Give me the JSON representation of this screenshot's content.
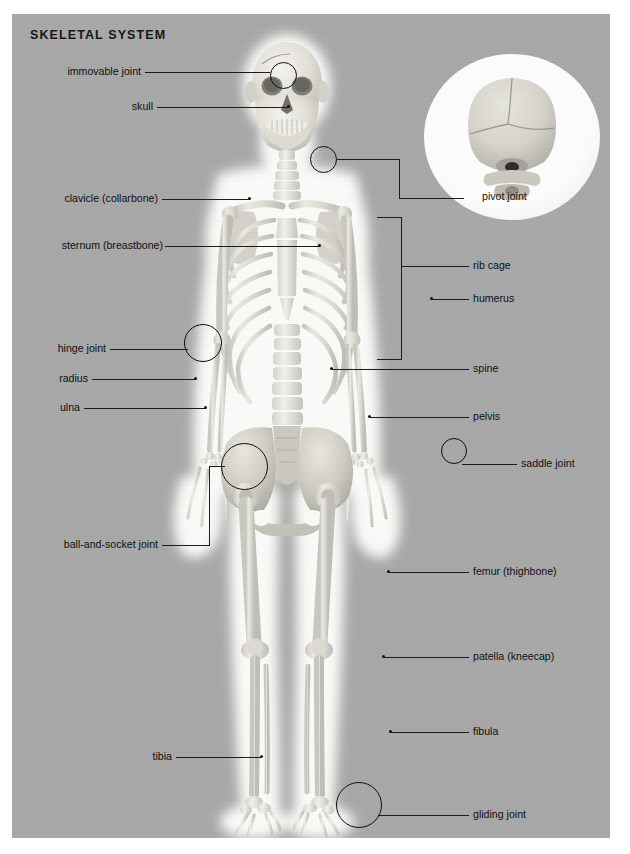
{
  "poster": {
    "title": "SKELETAL SYSTEM",
    "background_color": "#a8a8a8",
    "page_background": "#ffffff",
    "leader_color": "#1a1a1a",
    "text_color": "#0d0d0d"
  },
  "figure": {
    "name": "human-skeleton-anterior-view"
  },
  "inset": {
    "name": "pivot-joint-detail",
    "caption": "pivot joint",
    "description": "Posterior view of skull with atlas and axis vertebrae"
  },
  "labels_left": [
    {
      "id": "immovable-joint",
      "text": "immovable joint"
    },
    {
      "id": "skull",
      "text": "skull"
    },
    {
      "id": "clavicle",
      "text": "clavicle (collarbone)"
    },
    {
      "id": "sternum",
      "text": "sternum (breastbone)"
    },
    {
      "id": "hinge-joint",
      "text": "hinge joint"
    },
    {
      "id": "radius",
      "text": "radius"
    },
    {
      "id": "ulna",
      "text": "ulna"
    },
    {
      "id": "ball-and-socket-joint",
      "text": "ball-and-socket joint"
    },
    {
      "id": "tibia",
      "text": "tibia"
    }
  ],
  "labels_right": [
    {
      "id": "pivot-joint",
      "text": "pivot joint"
    },
    {
      "id": "rib-cage",
      "text": "rib cage"
    },
    {
      "id": "humerus",
      "text": "humerus"
    },
    {
      "id": "spine",
      "text": "spine"
    },
    {
      "id": "pelvis",
      "text": "pelvis"
    },
    {
      "id": "saddle-joint",
      "text": "saddle joint"
    },
    {
      "id": "femur",
      "text": "femur (thighbone)"
    },
    {
      "id": "patella",
      "text": "patella (kneecap)"
    },
    {
      "id": "fibula",
      "text": "fibula"
    },
    {
      "id": "gliding-joint",
      "text": "gliding joint"
    }
  ],
  "callout_rings": [
    {
      "id": "ring-immovable-joint",
      "for": "immovable joint"
    },
    {
      "id": "ring-pivot-joint",
      "for": "pivot joint"
    },
    {
      "id": "ring-hinge-joint",
      "for": "hinge joint"
    },
    {
      "id": "ring-ball-and-socket",
      "for": "ball-and-socket joint"
    },
    {
      "id": "ring-saddle-joint",
      "for": "saddle joint"
    },
    {
      "id": "ring-gliding-joint",
      "for": "gliding joint"
    }
  ]
}
